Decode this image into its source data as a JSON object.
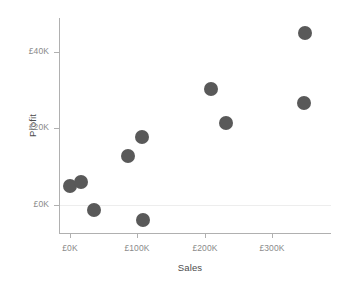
{
  "chart_data": {
    "type": "scatter",
    "title": "",
    "xlabel": "Sales",
    "ylabel": "Profit",
    "xlim": [
      -30000,
      360000
    ],
    "ylim": [
      -11000,
      51000
    ],
    "grid": false,
    "legend": null,
    "marker_color": "#595959",
    "marker_size_px": 14,
    "axis_color": "#b0b0b0",
    "tick_label_color": "#8a8a8a",
    "axis_title_color": "#4c4c4c",
    "zero_line_color": "#ededed",
    "x_ticks": [
      {
        "label": "£0K",
        "value": 0,
        "px": 70
      },
      {
        "label": "£100K",
        "value": 100000,
        "px": 137
      },
      {
        "label": "£200K",
        "value": 200000,
        "px": 205
      },
      {
        "label": "£300K",
        "value": 300000,
        "px": 272
      }
    ],
    "y_ticks": [
      {
        "label": "£40K",
        "value": 40000,
        "px": 52
      },
      {
        "label": "£20K",
        "value": 20000,
        "px": 128
      },
      {
        "label": "£0K",
        "value": 0,
        "px": 205
      }
    ],
    "points": [
      {
        "x": 20000,
        "y": 6200,
        "px": 70,
        "py": 186
      },
      {
        "x": 36000,
        "y": 6800,
        "px": 81,
        "py": 182
      },
      {
        "x": 72000,
        "y": -1200,
        "px": 94,
        "py": 210
      },
      {
        "x": 131000,
        "y": 13000,
        "px": 128,
        "py": 156
      },
      {
        "x": 152000,
        "y": 18600,
        "px": 142,
        "py": 137
      },
      {
        "x": 190000,
        "y": -2800,
        "px": 143,
        "py": 220
      },
      {
        "x": 201000,
        "y": 30200,
        "px": 211,
        "py": 89
      },
      {
        "x": 232000,
        "y": 21400,
        "px": 226,
        "py": 123
      },
      {
        "x": 312000,
        "y": 44800,
        "px": 305,
        "py": 33
      },
      {
        "x": 309000,
        "y": 26600,
        "px": 304,
        "py": 103
      }
    ]
  }
}
